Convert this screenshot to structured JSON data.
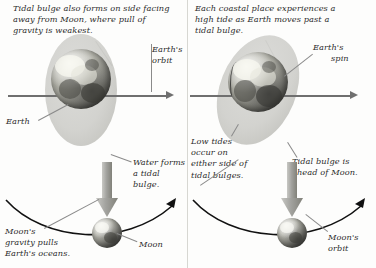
{
  "figure": {
    "colors": {
      "ink": "#2b2b2b",
      "line": "#6f6f6f",
      "leader": "#8a8a8a",
      "bulge": "#cfcfcb",
      "background": "#fdfdfc",
      "gray_arrow": "#9a9a9a"
    }
  },
  "panels": [
    {
      "id": "left",
      "caption": "Tidal bulge also forms on side facing away from Moon, where pull of gravity is weakest.",
      "labels": {
        "earth": "Earth",
        "earths_orbit": "Earth's\norbit",
        "earths_orbit_line1": "Earth's",
        "earths_orbit_line2": "orbit",
        "water_forms": "Water forms\na tidal bulge.",
        "water_forms_line1": "Water forms",
        "water_forms_line2": "a tidal bulge.",
        "moons_gravity": "Moon's gravity pulls Earth's oceans.",
        "moons_gravity_line1": "Moon's",
        "moons_gravity_line2": "gravity pulls",
        "moons_gravity_line3": "Earth's oceans.",
        "moon": "Moon"
      },
      "icons": {
        "orbit_arrow": "arrow-right-icon",
        "pull_arrow": "arrow-down-icon",
        "orbit_curve": "moon-orbit-curve-icon"
      }
    },
    {
      "id": "right",
      "caption": "Each coastal place experiences a high tide as Earth moves past a tidal bulge.",
      "labels": {
        "earths_spin": "Earth's\nspin",
        "earths_spin_line1": "Earth's",
        "earths_spin_line2": "spin",
        "low_tides": "Low tides occur on either side of tidal bulges.",
        "low_tides_line1": "Low tides",
        "low_tides_line2": "occur on",
        "low_tides_line3": "either side of",
        "low_tides_line4": "tidal bulges.",
        "tidal_bulge_ahead": "Tidal bulge is ahead of Moon.",
        "tidal_bulge_ahead_line1": "Tidal bulge is",
        "tidal_bulge_ahead_line2": "ahead of Moon.",
        "moons_orbit": "Moon's\norbit",
        "moons_orbit_line1": "Moon's",
        "moons_orbit_line2": "orbit"
      },
      "icons": {
        "spin_arrow": "arrow-right-icon",
        "pull_arrow": "arrow-down-icon",
        "orbit_curve": "moon-orbit-curve-icon"
      }
    }
  ]
}
